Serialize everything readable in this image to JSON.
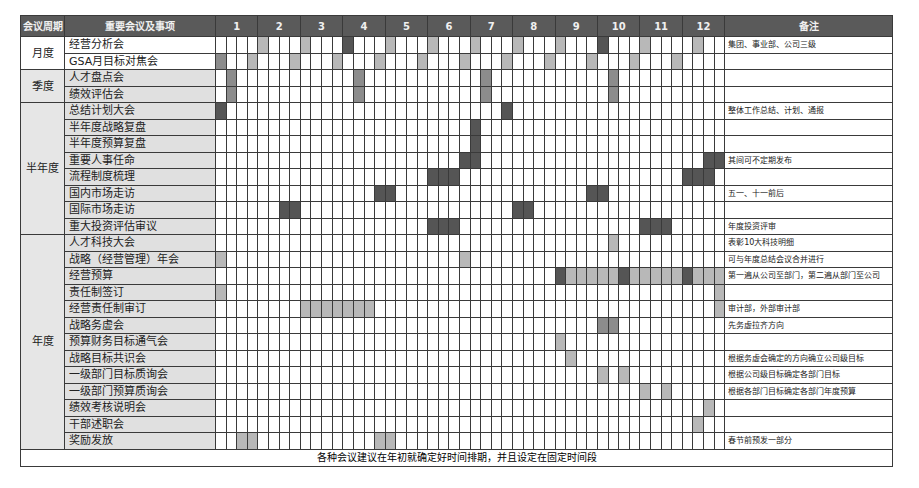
{
  "header": {
    "period": "会议周期",
    "item": "重要会议及事项",
    "months": [
      "1",
      "2",
      "3",
      "4",
      "5",
      "6",
      "7",
      "8",
      "9",
      "10",
      "11",
      "12"
    ],
    "notes": "备注"
  },
  "groups": [
    {
      "period": "月度",
      "style": "white",
      "rows": [
        {
          "item": "经营分析会",
          "note": "集团、事业部、公司三级",
          "cells": {
            "4": "l",
            "8": "l",
            "12": "d",
            "16": "l",
            "20": "l",
            "24": "l",
            "28": "l",
            "32": "l",
            "36": "d",
            "40": "l",
            "45": "l"
          }
        },
        {
          "item": "GSA月目标对焦会",
          "note": "",
          "cells": {
            "0": "g",
            "3": "l",
            "7": "l",
            "11": "l",
            "15": "l",
            "19": "l",
            "23": "l",
            "27": "l",
            "31": "l",
            "35": "l",
            "39": "l",
            "43": "l"
          }
        }
      ]
    },
    {
      "period": "季度",
      "style": "gray",
      "rows": [
        {
          "item": "人才盘点会",
          "note": "",
          "cells": {
            "1": "g",
            "13": "g",
            "25": "g",
            "37": "g"
          }
        },
        {
          "item": "绩效评估会",
          "note": "",
          "cells": {
            "1": "g",
            "13": "g",
            "25": "g",
            "37": "g"
          }
        }
      ]
    },
    {
      "period": "半年度",
      "style": "gray",
      "rows": [
        {
          "item": "总结计划大会",
          "note": "整体工作总结、计划、通报",
          "cells": {
            "0": "d",
            "27": "d"
          }
        },
        {
          "item": "半年度战略复盘",
          "note": "",
          "cells": {
            "24": "d"
          }
        },
        {
          "item": "半年度预算复盘",
          "note": "",
          "cells": {
            "24": "d"
          }
        },
        {
          "item": "重要人事任命",
          "note": "其间可不定期发布",
          "cells": {
            "23": "d",
            "24": "d",
            "46": "d",
            "47": "d"
          }
        },
        {
          "item": "流程制度梳理",
          "note": "",
          "cells": {
            "20": "d",
            "21": "d",
            "22": "d",
            "44": "d",
            "45": "d",
            "46": "d"
          }
        },
        {
          "item": "国内市场走访",
          "note": "五一、十一前后",
          "cells": {
            "15": "d",
            "16": "d",
            "35": "d",
            "36": "d"
          }
        },
        {
          "item": "国际市场走访",
          "note": "",
          "cells": {
            "6": "d",
            "7": "d",
            "28": "d",
            "29": "d"
          }
        },
        {
          "item": "重大投资评估审议",
          "note": "年度投资评审",
          "cells": {
            "20": "d",
            "21": "d",
            "22": "d",
            "40": "d",
            "41": "d",
            "42": "d"
          }
        }
      ]
    },
    {
      "period": "年度",
      "style": "gray",
      "rows": [
        {
          "item": "人才科技大会",
          "note": "表彰10大科技明细",
          "cells": {
            "37": "l"
          }
        },
        {
          "item": "战略（经营管理）年会",
          "note": "可与年度总结会议合并进行",
          "cells": {
            "0": "l",
            "23": "l"
          }
        },
        {
          "item": "经营预算",
          "note": "第一遍从公司至部门，第二遍从部门至公司",
          "cells": {
            "32": "d",
            "33": "l",
            "34": "l",
            "35": "l",
            "36": "l",
            "37": "l",
            "38": "d",
            "39": "l",
            "40": "l",
            "41": "l",
            "42": "l",
            "43": "l",
            "44": "d",
            "45": "l",
            "46": "l",
            "47": "l"
          }
        },
        {
          "item": "责任制签订",
          "note": "",
          "cells": {
            "0": "l",
            "47": "l"
          }
        },
        {
          "item": "经营责任制审订",
          "note": "审计部，外部审计部",
          "cells": {
            "8": "l",
            "9": "l",
            "10": "l",
            "11": "l",
            "12": "l",
            "13": "l",
            "14": "l",
            "47": "l"
          }
        },
        {
          "item": "战略务虚会",
          "note": "先务虚拉齐方向",
          "cells": {
            "36": "g",
            "37": "g"
          }
        },
        {
          "item": "预算财务目标通气会",
          "note": "",
          "cells": {
            "32": "l"
          }
        },
        {
          "item": "战略目标共识会",
          "note": "根据务虚会确定的方向确立公司级目标",
          "cells": {
            "33": "l"
          }
        },
        {
          "item": "一级部门目标质询会",
          "note": "根据公司级目标确定各部门目标",
          "cells": {
            "36": "l",
            "38": "l"
          }
        },
        {
          "item": "一级部门预算质询会",
          "note": "根据各部门目标确定各部门年度预算",
          "cells": {
            "40": "l",
            "42": "l"
          }
        },
        {
          "item": "绩效考核说明会",
          "note": "",
          "cells": {
            "46": "l"
          }
        },
        {
          "item": "干部述职会",
          "note": "",
          "cells": {
            "45": "l"
          }
        },
        {
          "item": "奖励发放",
          "note": "春节前预发一部分",
          "cells": {
            "2": "l",
            "3": "l",
            "15": "l",
            "16": "l"
          }
        }
      ]
    }
  ],
  "footer": "各种会议建议在年初就确定好时间排期，并且设定在固定时间段",
  "colors": {
    "header_bg": "#5a5a5a",
    "light": "#b8b8b8",
    "mid": "#8c8c8c",
    "dark": "#555555",
    "label_bg": "#e0e0e0"
  }
}
